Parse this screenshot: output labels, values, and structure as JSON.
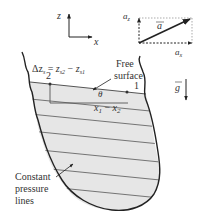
{
  "figure": {
    "axes": {
      "z_label": "z",
      "x_label": "x"
    },
    "acceleration": {
      "vector_label": "a",
      "az_label": "a",
      "az_sub": "z",
      "ax_label": "a",
      "ax_sub": "x"
    },
    "gravity": {
      "label": "g"
    },
    "equation": {
      "lhs": "Δz",
      "lhs_sub": "s",
      "eq": " = ",
      "t1": "z",
      "t1_sub": "s2",
      "minus": " − ",
      "t2": "z",
      "t2_sub": "s1"
    },
    "points": {
      "p1": "1",
      "p2": "2"
    },
    "angle_label": "θ",
    "distance_label": {
      "a": "x",
      "a_sub": "1",
      "minus": " − ",
      "b": "x",
      "b_sub": "2"
    },
    "annotations": {
      "free_surface_line1": "Free",
      "free_surface_line2": "surface",
      "constant_pressure_line1": "Constant",
      "constant_pressure_line2": "pressure",
      "constant_pressure_line3": "lines"
    },
    "colors": {
      "fluid_fill": "#e6e6e6",
      "line": "#555555",
      "outline": "#222222"
    }
  }
}
